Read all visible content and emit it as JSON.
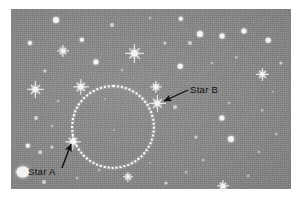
{
  "figure": {
    "plate": {
      "background_color": "#8a8a8a",
      "left": 11,
      "top": 9,
      "width": 280,
      "height": 180
    },
    "border_color": "#ffffff"
  },
  "annotations": {
    "circle": {
      "name": "dotted-circle",
      "center_x": 113,
      "center_y": 127,
      "radius": 42,
      "stroke_color": "#fdfdfd",
      "style": "dotted"
    },
    "labels": [
      {
        "id": "star-a",
        "text": "Star A",
        "x": 28,
        "y": 166,
        "arrow_from_x": 62,
        "arrow_from_y": 168,
        "arrow_to_x": 71,
        "arrow_to_y": 144
      },
      {
        "id": "star-b",
        "text": "Star B",
        "x": 190,
        "y": 84,
        "arrow_from_x": 188,
        "arrow_from_y": 90,
        "arrow_to_x": 164,
        "arrow_to_y": 101
      }
    ]
  },
  "labeled_stars": [
    {
      "id": "star-a",
      "label": "Star A",
      "x": 73,
      "y": 142,
      "size": 16,
      "brightness": "bright"
    },
    {
      "id": "star-b",
      "label": "Star B",
      "x": 157,
      "y": 103,
      "size": 17,
      "brightness": "bright"
    }
  ],
  "spike_stars": [
    {
      "x": 134,
      "y": 53,
      "size": 19
    },
    {
      "x": 81,
      "y": 87,
      "size": 16
    },
    {
      "x": 35,
      "y": 89,
      "size": 17
    },
    {
      "x": 63,
      "y": 51,
      "size": 12
    },
    {
      "x": 262,
      "y": 74,
      "size": 13
    },
    {
      "x": 156,
      "y": 87,
      "size": 12
    },
    {
      "x": 223,
      "y": 186,
      "size": 12
    },
    {
      "x": 128,
      "y": 177,
      "size": 10
    }
  ],
  "blob_stars": [
    {
      "x": 23,
      "y": 172,
      "w": 13,
      "h": 11
    }
  ],
  "point_stars": [
    {
      "x": 56,
      "y": 20,
      "r": 3.0,
      "class": ""
    },
    {
      "x": 82,
      "y": 40,
      "r": 2.2,
      "class": ""
    },
    {
      "x": 30,
      "y": 43,
      "r": 2.0,
      "class": ""
    },
    {
      "x": 112,
      "y": 25,
      "r": 2.0,
      "class": "dim"
    },
    {
      "x": 181,
      "y": 19,
      "r": 2.2,
      "class": ""
    },
    {
      "x": 190,
      "y": 43,
      "r": 2.1,
      "class": "dim"
    },
    {
      "x": 200,
      "y": 34,
      "r": 3.0,
      "class": ""
    },
    {
      "x": 222,
      "y": 36,
      "r": 2.4,
      "class": ""
    },
    {
      "x": 244,
      "y": 31,
      "r": 2.6,
      "class": ""
    },
    {
      "x": 268,
      "y": 40,
      "r": 2.3,
      "class": ""
    },
    {
      "x": 165,
      "y": 43,
      "r": 1.6,
      "class": "dim"
    },
    {
      "x": 150,
      "y": 18,
      "r": 1.4,
      "class": "faint"
    },
    {
      "x": 96,
      "y": 62,
      "r": 2.6,
      "class": ""
    },
    {
      "x": 45,
      "y": 71,
      "r": 1.6,
      "class": "dim"
    },
    {
      "x": 122,
      "y": 70,
      "r": 1.4,
      "class": "faint"
    },
    {
      "x": 180,
      "y": 66,
      "r": 2.3,
      "class": ""
    },
    {
      "x": 212,
      "y": 63,
      "r": 1.5,
      "class": "faint"
    },
    {
      "x": 236,
      "y": 57,
      "r": 1.3,
      "class": "faint"
    },
    {
      "x": 281,
      "y": 63,
      "r": 1.6,
      "class": "dim"
    },
    {
      "x": 58,
      "y": 101,
      "r": 1.5,
      "class": "faint"
    },
    {
      "x": 175,
      "y": 107,
      "r": 2.0,
      "class": "dim"
    },
    {
      "x": 229,
      "y": 103,
      "r": 1.4,
      "class": "faint"
    },
    {
      "x": 262,
      "y": 110,
      "r": 1.3,
      "class": "faint"
    },
    {
      "x": 36,
      "y": 118,
      "r": 2.0,
      "class": "dim"
    },
    {
      "x": 52,
      "y": 126,
      "r": 1.4,
      "class": "faint"
    },
    {
      "x": 222,
      "y": 118,
      "r": 2.6,
      "class": ""
    },
    {
      "x": 196,
      "y": 137,
      "r": 1.6,
      "class": "dim"
    },
    {
      "x": 231,
      "y": 139,
      "r": 3.0,
      "class": ""
    },
    {
      "x": 203,
      "y": 160,
      "r": 1.3,
      "class": "faint"
    },
    {
      "x": 259,
      "y": 152,
      "r": 1.5,
      "class": "faint"
    },
    {
      "x": 276,
      "y": 134,
      "r": 1.4,
      "class": "faint"
    },
    {
      "x": 28,
      "y": 146,
      "r": 2.2,
      "class": ""
    },
    {
      "x": 40,
      "y": 152,
      "r": 1.8,
      "class": "dim"
    },
    {
      "x": 52,
      "y": 147,
      "r": 1.6,
      "class": "dim"
    },
    {
      "x": 44,
      "y": 182,
      "r": 2.0,
      "class": "dim"
    },
    {
      "x": 77,
      "y": 178,
      "r": 1.5,
      "class": "faint"
    },
    {
      "x": 99,
      "y": 170,
      "r": 1.4,
      "class": "faint"
    },
    {
      "x": 166,
      "y": 183,
      "r": 1.6,
      "class": "dim"
    },
    {
      "x": 186,
      "y": 172,
      "r": 1.3,
      "class": "faint"
    },
    {
      "x": 150,
      "y": 163,
      "r": 1.2,
      "class": "faint"
    },
    {
      "x": 248,
      "y": 176,
      "r": 1.4,
      "class": "faint"
    },
    {
      "x": 273,
      "y": 92,
      "r": 1.2,
      "class": "faint"
    },
    {
      "x": 105,
      "y": 99,
      "r": 1.2,
      "class": "faint"
    },
    {
      "x": 114,
      "y": 130,
      "r": 1.1,
      "class": "faint"
    }
  ]
}
